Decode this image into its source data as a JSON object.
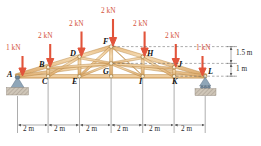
{
  "figure": {
    "type": "truss-free-body-diagram",
    "units": {
      "force": "kN",
      "length": "m"
    }
  },
  "loads": [
    {
      "id": "load-A",
      "label": "1 kN",
      "magnitude": 1,
      "unit": "kN",
      "at_node": "A",
      "direction": "down"
    },
    {
      "id": "load-B",
      "label": "2 kN",
      "magnitude": 2,
      "unit": "kN",
      "at_node": "B",
      "direction": "down"
    },
    {
      "id": "load-D",
      "label": "2 kN",
      "magnitude": 2,
      "unit": "kN",
      "at_node": "D",
      "direction": "down"
    },
    {
      "id": "load-F",
      "label": "2 kN",
      "magnitude": 2,
      "unit": "kN",
      "at_node": "F",
      "direction": "down"
    },
    {
      "id": "load-H",
      "label": "2 kN",
      "magnitude": 2,
      "unit": "kN",
      "at_node": "H",
      "direction": "down"
    },
    {
      "id": "load-J",
      "label": "2 kN",
      "magnitude": 2,
      "unit": "kN",
      "at_node": "J",
      "direction": "down"
    },
    {
      "id": "load-L",
      "label": "1 kN",
      "magnitude": 1,
      "unit": "kN",
      "at_node": "L",
      "direction": "down"
    }
  ],
  "nodes": [
    {
      "id": "A",
      "label": "A",
      "x_m": 0,
      "y_m": 0
    },
    {
      "id": "B",
      "label": "B",
      "x_m": 2,
      "y_m": 0.5
    },
    {
      "id": "C",
      "label": "C",
      "x_m": 2,
      "y_m": 0
    },
    {
      "id": "D",
      "label": "D",
      "x_m": 4,
      "y_m": 1.0
    },
    {
      "id": "E",
      "label": "E",
      "x_m": 4,
      "y_m": 0
    },
    {
      "id": "F",
      "label": "F",
      "x_m": 6,
      "y_m": 1.5
    },
    {
      "id": "G",
      "label": "G",
      "x_m": 6,
      "y_m": 0
    },
    {
      "id": "H",
      "label": "H",
      "x_m": 8,
      "y_m": 1.0
    },
    {
      "id": "I",
      "label": "I",
      "x_m": 8,
      "y_m": 0
    },
    {
      "id": "J",
      "label": "J",
      "x_m": 10,
      "y_m": 0.5
    },
    {
      "id": "K",
      "label": "K",
      "x_m": 10,
      "y_m": 0
    },
    {
      "id": "L",
      "label": "L",
      "x_m": 12,
      "y_m": 0
    }
  ],
  "supports": [
    {
      "id": "support-A",
      "at_node": "A",
      "type": "pin"
    },
    {
      "id": "support-L",
      "at_node": "L",
      "type": "rocker"
    }
  ],
  "dimensions": {
    "horizontal": {
      "segments": [
        "2 m",
        "2 m",
        "2 m",
        "2 m",
        "2 m",
        "2 m"
      ],
      "total_m": 12
    },
    "vertical": [
      {
        "id": "dim-upper",
        "label": "1.5 m",
        "value_m": 1.5
      },
      {
        "id": "dim-lower",
        "label": "1 m",
        "value_m": 1
      }
    ]
  },
  "colors": {
    "member": "#e8c08a",
    "member_edge": "#b5813c",
    "load_arrow": "#e2543b",
    "load_text": "#d4523a",
    "support": "#7f98ad",
    "ground": "#c8bfb2",
    "dim_line": "#5a5a5a",
    "node_label": "#111111"
  }
}
